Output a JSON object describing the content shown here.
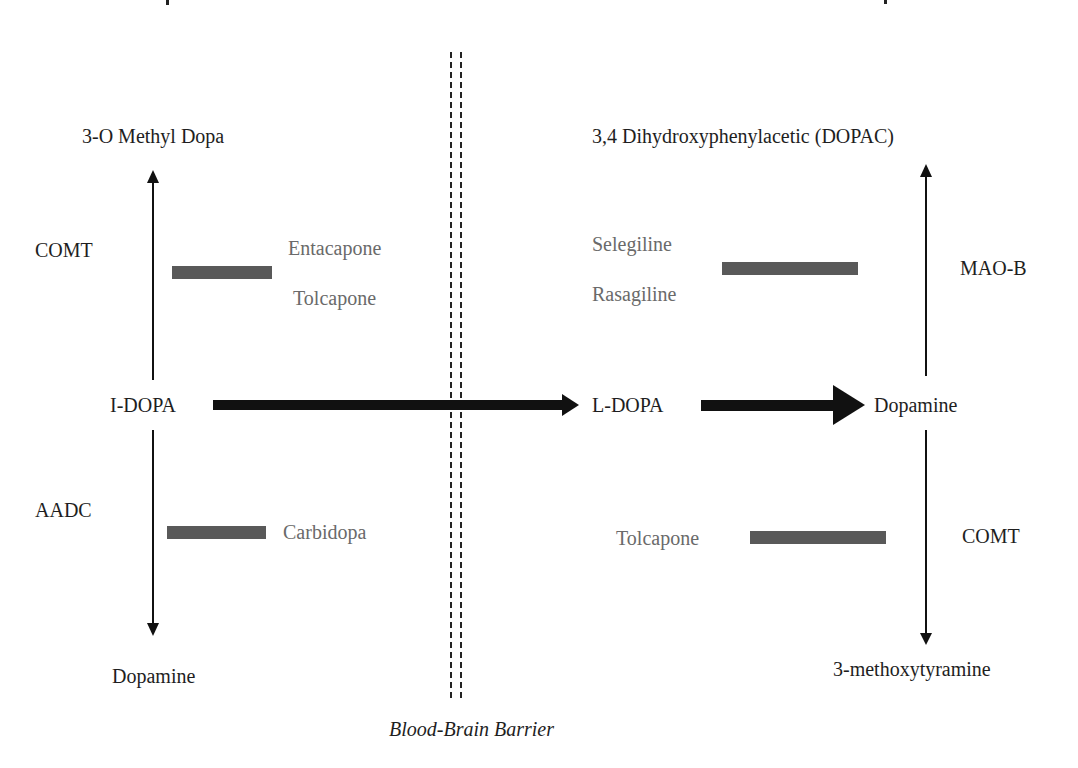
{
  "diagram": {
    "type": "metabolic-pathway",
    "colors": {
      "text": "#1e1e1e",
      "drug_text": "#6a6a6a",
      "inhibitor_bar": "#595959",
      "arrow": "#111111",
      "background": "#ffffff"
    },
    "periphery": {
      "top_product": "3-O Methyl Dopa",
      "top_enzyme": "COMT",
      "top_inhibitors": [
        "Entacapone",
        "Tolcapone"
      ],
      "center_substrate": "I-DOPA",
      "bottom_enzyme": "AADC",
      "bottom_inhibitors": [
        "Carbidopa"
      ],
      "bottom_product": "Dopamine"
    },
    "barrier": {
      "label": "Blood-Brain Barrier"
    },
    "brain": {
      "substrate": "L-DOPA",
      "center_product": "Dopamine",
      "top_product": "3,4 Dihydroxyphenylacetic (DOPAC)",
      "top_enzyme": "MAO-B",
      "top_inhibitors": [
        "Selegiline",
        "Rasagiline"
      ],
      "bottom_enzyme": "COMT",
      "bottom_inhibitors": [
        "Tolcapone"
      ],
      "bottom_product": "3-methoxytyramine"
    },
    "edges": [
      {
        "from": "I-DOPA",
        "to": "3-O Methyl Dopa",
        "enzyme": "COMT",
        "inhibited_by": [
          "Entacapone",
          "Tolcapone"
        ]
      },
      {
        "from": "I-DOPA",
        "to": "Dopamine",
        "enzyme": "AADC",
        "inhibited_by": [
          "Carbidopa"
        ]
      },
      {
        "from": "I-DOPA",
        "to": "L-DOPA",
        "crosses": "Blood-Brain Barrier"
      },
      {
        "from": "L-DOPA",
        "to": "Dopamine"
      },
      {
        "from": "Dopamine",
        "to": "3,4 Dihydroxyphenylacetic (DOPAC)",
        "enzyme": "MAO-B",
        "inhibited_by": [
          "Selegiline",
          "Rasagiline"
        ]
      },
      {
        "from": "Dopamine",
        "to": "3-methoxytyramine",
        "enzyme": "COMT",
        "inhibited_by": [
          "Tolcapone"
        ]
      }
    ]
  }
}
